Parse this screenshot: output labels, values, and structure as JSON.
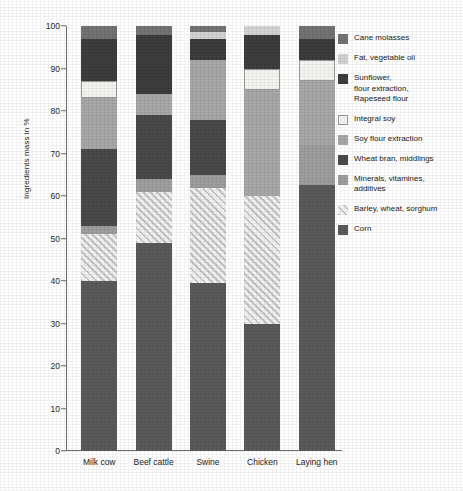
{
  "chart_data": {
    "type": "bar",
    "title": "",
    "xlabel": "",
    "ylabel": "Ingredients mass in %",
    "ylim": [
      0,
      100
    ],
    "yticks": [
      0,
      10,
      20,
      30,
      40,
      50,
      60,
      70,
      80,
      90,
      100
    ],
    "grid": false,
    "stacked": true,
    "legend_position": "right",
    "categories": [
      "Milk cow",
      "Beef cattle",
      "Swine",
      "Chicken",
      "Laying hen"
    ],
    "series": [
      {
        "name": "Corn",
        "color": "#5a5a5a",
        "pattern": "solid",
        "values": [
          40,
          49,
          39.5,
          30,
          62.5
        ]
      },
      {
        "name": "Barley, wheat, sorghum",
        "color": "#c7c7c7",
        "pattern": "hatch",
        "values": [
          11,
          12,
          22.5,
          30,
          0
        ]
      },
      {
        "name": "Minerals, vitamines, additives",
        "color": "#9e9e9e",
        "pattern": "solid",
        "values": [
          2,
          3,
          3,
          0,
          9.5
        ]
      },
      {
        "name": "Wheat bran, middlings",
        "color": "#4a4a4a",
        "pattern": "solid",
        "values": [
          18,
          15,
          13,
          0,
          0
        ]
      },
      {
        "name": "Soy flour extraction",
        "color": "#a8a8a8",
        "pattern": "solid",
        "values": [
          12,
          5,
          14,
          25,
          15
        ]
      },
      {
        "name": "Integral soy",
        "color": "#f5f5f2",
        "pattern": "outline",
        "values": [
          4,
          0,
          0,
          5,
          5
        ]
      },
      {
        "name": "Sunflower, flour extraction, Rapeseed flour",
        "color": "#3d3d3d",
        "pattern": "solid",
        "values": [
          10,
          14,
          5,
          8,
          5
        ]
      },
      {
        "name": "Fat, vegetable oil",
        "color": "#d3d3d3",
        "pattern": "solid",
        "values": [
          0,
          0,
          1.5,
          2,
          0
        ]
      },
      {
        "name": "Cane molasses",
        "color": "#737373",
        "pattern": "solid",
        "values": [
          3,
          2,
          1.5,
          0,
          3
        ]
      }
    ]
  },
  "legend": {
    "items": [
      {
        "label": "Cane molasses",
        "color": "#737373",
        "pattern": "solid"
      },
      {
        "label": "Fat, vegetable oil",
        "color": "#d3d3d3",
        "pattern": "solid"
      },
      {
        "label": "Sunflower,\nflour extraction,\nRapeseed flour",
        "color": "#3d3d3d",
        "pattern": "solid"
      },
      {
        "label": "Integral soy",
        "color": "#f5f5f2",
        "pattern": "outline"
      },
      {
        "label": "Soy flour extraction",
        "color": "#a8a8a8",
        "pattern": "solid"
      },
      {
        "label": "Wheat bran, middlings",
        "color": "#4a4a4a",
        "pattern": "solid"
      },
      {
        "label": "Minerals, vitamines,\nadditives",
        "color": "#9e9e9e",
        "pattern": "solid"
      },
      {
        "label": "Barley, wheat, sorghum",
        "color": "#c7c7c7",
        "pattern": "hatch"
      },
      {
        "label": "Corn",
        "color": "#5a5a5a",
        "pattern": "solid"
      }
    ]
  }
}
